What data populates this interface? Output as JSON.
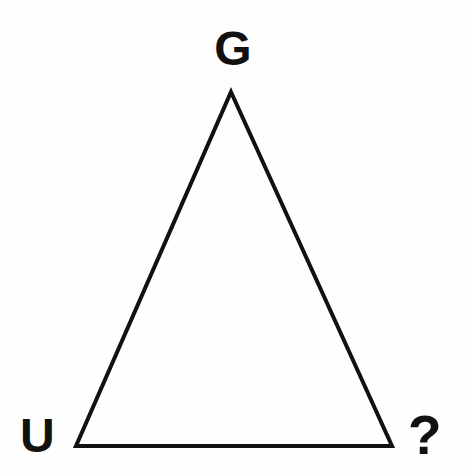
{
  "figure": {
    "type": "geometric-diagram",
    "shape": "triangle",
    "background_color": "#fefefe",
    "stroke_color": "#111111",
    "stroke_width": 4,
    "canvas": {
      "width": 472,
      "height": 475
    },
    "vertices": [
      {
        "id": "apex",
        "label": "G",
        "x": 231,
        "y": 92
      },
      {
        "id": "bottom-left",
        "label": "U",
        "x": 76,
        "y": 446
      },
      {
        "id": "bottom-right",
        "label": "?",
        "x": 392,
        "y": 446
      }
    ],
    "labels": {
      "apex": "G",
      "bottom_left": "U",
      "bottom_right": "?"
    }
  }
}
